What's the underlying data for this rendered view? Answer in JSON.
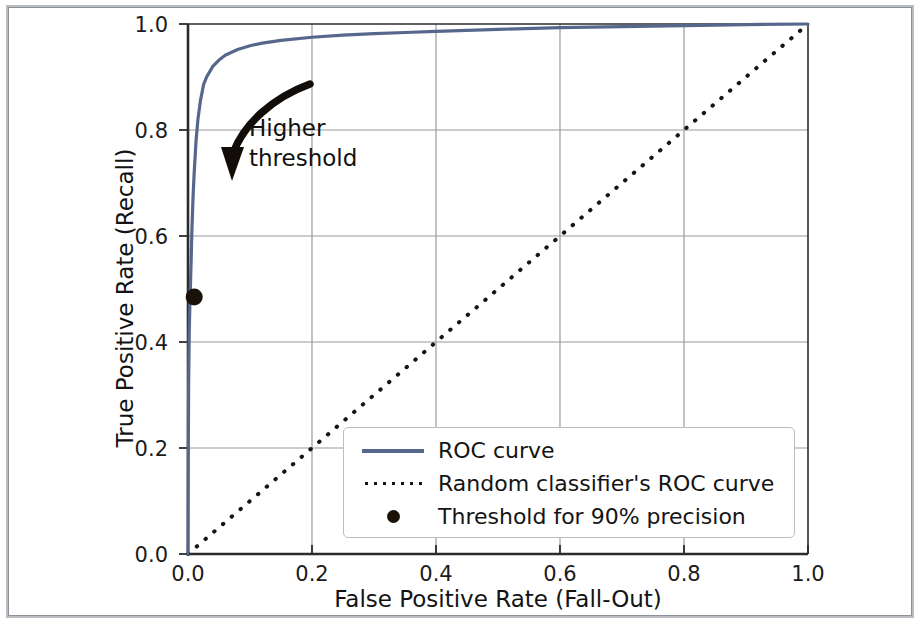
{
  "figure": {
    "xlabel": "False Positive Rate (Fall-Out)",
    "ylabel": "True Positive Rate (Recall)",
    "annotation_line1": "Higher",
    "annotation_line2": "threshold"
  },
  "legend": {
    "entries": [
      {
        "label": "ROC curve",
        "marker": "line",
        "color": "#57678c"
      },
      {
        "label": "Random classifier's ROC curve",
        "marker": "dotted-line",
        "color": "#151515"
      },
      {
        "label": "Threshold for 90% precision",
        "marker": "dot",
        "color": "#1a1208"
      }
    ]
  },
  "axes": {
    "xticks": [
      "0.0",
      "0.2",
      "0.4",
      "0.6",
      "0.8",
      "1.0"
    ],
    "yticks": [
      "0.0",
      "0.2",
      "0.4",
      "0.6",
      "0.8",
      "1.0"
    ]
  },
  "chart_data": {
    "type": "line",
    "title": "",
    "xlabel": "False Positive Rate (Fall-Out)",
    "ylabel": "True Positive Rate (Recall)",
    "xlim": [
      0.0,
      1.0
    ],
    "ylim": [
      0.0,
      1.0
    ],
    "xticks": [
      0.0,
      0.2,
      0.4,
      0.6,
      0.8,
      1.0
    ],
    "yticks": [
      0.0,
      0.2,
      0.4,
      0.6,
      0.8,
      1.0
    ],
    "grid": true,
    "legend_position": "lower right",
    "series": [
      {
        "name": "ROC curve",
        "type": "line",
        "color": "#57678c",
        "linestyle": "solid",
        "linewidth": 2.5,
        "x": [
          0.0,
          0.0005,
          0.001,
          0.002,
          0.003,
          0.004,
          0.005,
          0.006,
          0.008,
          0.01,
          0.013,
          0.016,
          0.02,
          0.025,
          0.03,
          0.04,
          0.05,
          0.06,
          0.08,
          0.1,
          0.12,
          0.15,
          0.2,
          0.25,
          0.3,
          0.35,
          0.4,
          0.5,
          0.6,
          0.7,
          0.8,
          0.9,
          1.0
        ],
        "y": [
          0.0,
          0.2,
          0.32,
          0.42,
          0.47,
          0.51,
          0.55,
          0.6,
          0.67,
          0.72,
          0.78,
          0.82,
          0.855,
          0.885,
          0.9,
          0.92,
          0.932,
          0.941,
          0.952,
          0.959,
          0.964,
          0.969,
          0.975,
          0.979,
          0.982,
          0.984,
          0.986,
          0.99,
          0.993,
          0.995,
          0.997,
          0.999,
          1.0
        ]
      },
      {
        "name": "Random classifier's ROC curve",
        "type": "line",
        "color": "#151515",
        "linestyle": "dotted",
        "linewidth": 2,
        "x": [
          0.0,
          1.0
        ],
        "y": [
          0.0,
          1.0
        ]
      },
      {
        "name": "Threshold for 90% precision",
        "type": "scatter",
        "color": "#1a1208",
        "marker": "o",
        "x": [
          0.01
        ],
        "y": [
          0.485
        ]
      }
    ],
    "annotations": [
      {
        "text": "Higher threshold",
        "arrow": true,
        "arrow_from": [
          0.197,
          0.887
        ],
        "arrow_to": [
          0.072,
          0.726
        ]
      }
    ]
  }
}
